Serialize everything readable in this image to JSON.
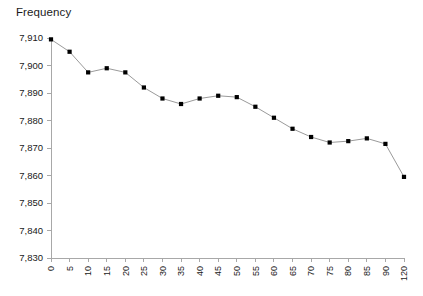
{
  "chart_data": {
    "type": "line",
    "title": "Frequency",
    "xlabel": "",
    "ylabel": "",
    "grid": false,
    "legend": "none",
    "markers": "square",
    "marker_color": "#000000",
    "line_color": "#9a9a9a",
    "axis_color": "#a8a8a8",
    "categories": [
      "0",
      "5",
      "10",
      "15",
      "20",
      "25",
      "30",
      "35",
      "40",
      "45",
      "50",
      "55",
      "60",
      "65",
      "70",
      "75",
      "80",
      "85",
      "90",
      "120"
    ],
    "values": [
      7909.5,
      7905.0,
      7897.5,
      7899.0,
      7897.5,
      7892.0,
      7888.0,
      7886.0,
      7888.0,
      7889.0,
      7888.5,
      7885.0,
      7881.0,
      7877.0,
      7874.0,
      7872.0,
      7872.5,
      7873.5,
      7871.5,
      7859.5
    ],
    "ylim": [
      7830,
      7910
    ],
    "ytick_values": [
      7910,
      7900,
      7890,
      7880,
      7870,
      7860,
      7850,
      7840,
      7830
    ],
    "ytick_labels": [
      "7,910",
      "7,900",
      "7,890",
      "7,880",
      "7,870",
      "7,860",
      "7,850",
      "7,840",
      "7,830"
    ],
    "xtick_labels": [
      "0",
      "5",
      "10",
      "15",
      "20",
      "25",
      "30",
      "35",
      "40",
      "45",
      "50",
      "55",
      "60",
      "65",
      "70",
      "75",
      "80",
      "85",
      "90",
      "120"
    ],
    "xtick_label_rotation": -90
  }
}
